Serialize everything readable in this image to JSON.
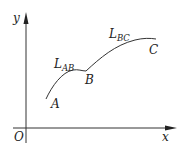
{
  "diagram": {
    "type": "coordinate-curve",
    "axes": {
      "x_label": "x",
      "y_label": "y",
      "origin_label": "O"
    },
    "points": [
      {
        "name": "A",
        "label": "A"
      },
      {
        "name": "B",
        "label": "B"
      },
      {
        "name": "C",
        "label": "C"
      }
    ],
    "segments": [
      {
        "name": "AB",
        "label_main": "L",
        "label_sub": "AB"
      },
      {
        "name": "BC",
        "label_main": "L",
        "label_sub": "BC"
      }
    ],
    "colors": {
      "stroke": "#333333",
      "background": "#ffffff"
    }
  }
}
